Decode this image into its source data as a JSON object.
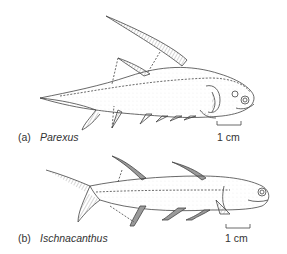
{
  "figure": {
    "panels": [
      {
        "tag": "(a)",
        "name": "Parexus",
        "scale_label": "1 cm"
      },
      {
        "tag": "(b)",
        "name": "Ischnacanthus",
        "scale_label": "1 cm"
      }
    ]
  },
  "colors": {
    "line": "#444444",
    "fin_shade": "#9a9a9a",
    "background": "#ffffff"
  }
}
